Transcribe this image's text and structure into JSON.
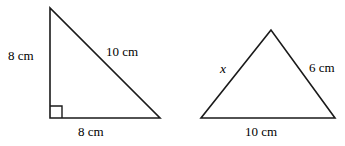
{
  "figure": {
    "background_color": "#ffffff",
    "stroke_color": "#1a1a1a",
    "text_color": "#000000",
    "width": 345,
    "height": 146,
    "shapes": [
      {
        "name": "right-triangle",
        "type": "triangle",
        "has_right_angle_marker": true,
        "right_angle_vertex": [
          50,
          118
        ],
        "points": [
          [
            50,
            8
          ],
          [
            50,
            118
          ],
          [
            160,
            118
          ]
        ],
        "labels": {
          "vertical_side": "8 cm",
          "hypotenuse": "10 cm",
          "base": "8 cm"
        }
      },
      {
        "name": "isosceles-triangle",
        "type": "triangle",
        "has_right_angle_marker": false,
        "points": [
          [
            271,
            30
          ],
          [
            201,
            118
          ],
          [
            335,
            118
          ]
        ],
        "labels": {
          "left_side": "x",
          "right_side": "6 cm",
          "base": "10 cm"
        }
      }
    ]
  }
}
